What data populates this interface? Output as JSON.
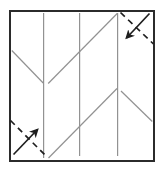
{
  "diagram": {
    "kind": "origami-crease-pattern-step",
    "canvas": {
      "width": 163,
      "height": 171
    },
    "colors": {
      "background": "#ffffff",
      "paper_fill": "#ffffff",
      "border": "#2b2b2b",
      "crease": "#929292",
      "fold": "#1e1e1e"
    },
    "paper": {
      "x": 10,
      "y": 11,
      "width": 144,
      "height": 150,
      "stroke_width": 2
    },
    "creases": {
      "stroke_width": 1.2,
      "vertical": [
        {
          "x": 43.6,
          "y1": 13,
          "y2": 158
        },
        {
          "x": 79.6,
          "y1": 13,
          "y2": 156
        },
        {
          "x": 117.6,
          "y1": 13,
          "y2": 156
        }
      ],
      "diagonal": [
        {
          "x1": 11.8,
          "y1": 50.5,
          "x2": 43.2,
          "y2": 83
        },
        {
          "x1": 48.2,
          "y1": 83.5,
          "x2": 117.2,
          "y2": 13.5
        },
        {
          "x1": 48.5,
          "y1": 158,
          "x2": 117.0,
          "y2": 88.5
        },
        {
          "x1": 121.0,
          "y1": 91.0,
          "x2": 152.3,
          "y2": 121.5
        }
      ]
    },
    "fold_marks": {
      "dash_pattern": "6 4.5",
      "stroke_width": 1.7,
      "items": [
        {
          "name": "top-right-fold",
          "direction": "down-left",
          "dashed_line": {
            "x1": 120.5,
            "y1": 12.5,
            "x2": 153.5,
            "y2": 44.0
          },
          "arrow": {
            "x1": 149.5,
            "y1": 13.5,
            "x2": 126.5,
            "y2": 38.0
          }
        },
        {
          "name": "bottom-left-fold",
          "direction": "up-right",
          "dashed_line": {
            "x1": 10.5,
            "y1": 120.5,
            "x2": 46.5,
            "y2": 156.5
          },
          "arrow": {
            "x1": 13.5,
            "y1": 154.5,
            "x2": 37.5,
            "y2": 129.5
          }
        }
      ]
    }
  }
}
